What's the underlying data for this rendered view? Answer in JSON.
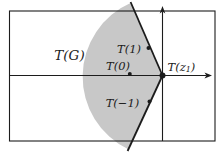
{
  "labels": {
    "region": "T(G)",
    "t_plus1": "T(1)",
    "t_zero": "T(0)",
    "t_minus1": "T(−1)",
    "t_z1": {
      "pre": "T(z",
      "sub": "1",
      "post": ")"
    }
  },
  "colors": {
    "shade": "#c8c8c8",
    "ink": "#1c1c1c"
  }
}
